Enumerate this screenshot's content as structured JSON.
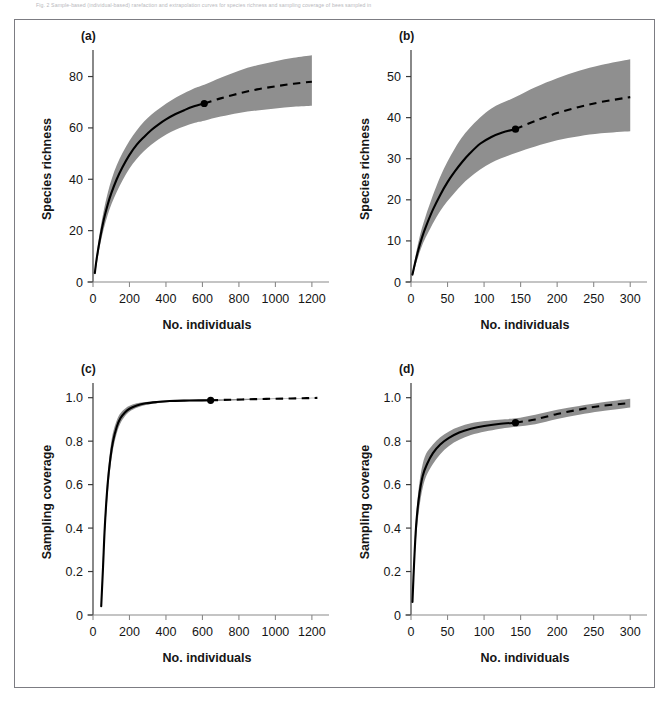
{
  "caption": {
    "text": "Fig. 2  Sample-based (individual-based) rarefaction and extrapolation curves for species richness and sampling coverage of bees sampled in"
  },
  "figure": {
    "background_color": "#ffffff",
    "frame_color": "#7c7c82",
    "band_color": "#8f8f8f",
    "line_color": "#000000"
  },
  "chart_data": [
    {
      "type": "line",
      "panel_label": "(a)",
      "title": "",
      "xlabel": "No. individuals",
      "ylabel": "Species richness",
      "xlim": [
        0,
        1250
      ],
      "ylim": [
        0,
        88
      ],
      "xticks": [
        0,
        200,
        400,
        600,
        800,
        1000,
        1200
      ],
      "xticklabels": [
        "0",
        "200",
        "400",
        "600",
        "800",
        "1000",
        "1200"
      ],
      "yticks": [
        0,
        20,
        40,
        60,
        80
      ],
      "yticklabels": [
        "0",
        "20",
        "40",
        "60",
        "80"
      ],
      "grid": false,
      "legend": "none",
      "observed_point": {
        "x": 610,
        "y": 69.5
      },
      "series": [
        {
          "name": "rarefaction (observed, solid)",
          "style": "solid",
          "x": [
            10,
            20,
            40,
            60,
            80,
            100,
            130,
            160,
            200,
            240,
            280,
            320,
            360,
            400,
            450,
            500,
            550,
            610
          ],
          "y": [
            3.5,
            9.0,
            17.5,
            24.5,
            30.0,
            34.5,
            40.0,
            44.5,
            49.5,
            53.5,
            56.5,
            59.2,
            61.4,
            63.3,
            65.3,
            66.9,
            68.3,
            69.5
          ]
        },
        {
          "name": "extrapolation (dashed)",
          "style": "dashed",
          "x": [
            610,
            700,
            800,
            900,
            1000,
            1100,
            1200
          ],
          "y": [
            69.5,
            71.5,
            73.4,
            75.0,
            76.2,
            77.2,
            78.0
          ]
        },
        {
          "name": "95% CI upper",
          "style": "band",
          "x": [
            10,
            40,
            80,
            130,
            200,
            280,
            360,
            450,
            550,
            610,
            700,
            800,
            900,
            1000,
            1100,
            1200
          ],
          "y": [
            5.0,
            20.5,
            34.5,
            45.5,
            55.0,
            62.5,
            67.4,
            71.6,
            75.2,
            76.8,
            79.5,
            82.3,
            84.4,
            86.0,
            87.3,
            88.3
          ]
        },
        {
          "name": "95% CI lower",
          "style": "band",
          "x": [
            10,
            40,
            80,
            130,
            200,
            280,
            360,
            450,
            550,
            610,
            700,
            800,
            900,
            1000,
            1100,
            1200
          ],
          "y": [
            2.2,
            14.8,
            26.0,
            35.0,
            44.2,
            51.0,
            55.6,
            59.2,
            61.8,
            62.8,
            64.4,
            65.8,
            66.8,
            67.6,
            68.2,
            68.6
          ]
        }
      ]
    },
    {
      "type": "line",
      "panel_label": "(b)",
      "title": "",
      "xlabel": "No. individuals",
      "ylabel": "Species richness",
      "xlim": [
        0,
        312
      ],
      "ylim": [
        0,
        55
      ],
      "xticks": [
        0,
        50,
        100,
        150,
        200,
        250,
        300
      ],
      "xticklabels": [
        "0",
        "50",
        "100",
        "150",
        "200",
        "250",
        "300"
      ],
      "yticks": [
        0,
        10,
        20,
        30,
        40,
        50
      ],
      "yticklabels": [
        "0",
        "10",
        "20",
        "30",
        "40",
        "50"
      ],
      "grid": false,
      "legend": "none",
      "observed_point": {
        "x": 143,
        "y": 37.2
      },
      "series": [
        {
          "name": "rarefaction (observed, solid)",
          "style": "solid",
          "x": [
            2,
            5,
            10,
            15,
            20,
            30,
            40,
            50,
            60,
            70,
            80,
            95,
            110,
            125,
            143
          ],
          "y": [
            1.8,
            4.2,
            7.8,
            10.8,
            13.3,
            17.6,
            21.2,
            24.3,
            26.9,
            29.2,
            31.2,
            33.7,
            35.3,
            36.4,
            37.2
          ]
        },
        {
          "name": "extrapolation (dashed)",
          "style": "dashed",
          "x": [
            143,
            170,
            200,
            230,
            260,
            300
          ],
          "y": [
            37.2,
            39.2,
            41.1,
            42.6,
            43.8,
            45.0
          ]
        },
        {
          "name": "95% CI upper",
          "style": "band",
          "x": [
            2,
            10,
            20,
            40,
            60,
            80,
            110,
            143,
            170,
            200,
            230,
            260,
            300
          ],
          "y": [
            2.4,
            9.6,
            16.0,
            25.6,
            32.5,
            37.4,
            42.2,
            45.0,
            47.4,
            49.6,
            51.4,
            52.8,
            54.2
          ]
        },
        {
          "name": "95% CI lower",
          "style": "band",
          "x": [
            2,
            10,
            20,
            40,
            60,
            80,
            110,
            143,
            170,
            200,
            230,
            260,
            300
          ],
          "y": [
            1.3,
            6.2,
            10.8,
            17.3,
            21.8,
            25.4,
            29.0,
            31.4,
            33.0,
            34.5,
            35.5,
            36.2,
            36.7
          ]
        }
      ]
    },
    {
      "type": "line",
      "panel_label": "(c)",
      "title": "",
      "xlabel": "No. individuals",
      "ylabel": "Sampling coverage",
      "xlim": [
        0,
        1250
      ],
      "ylim": [
        0,
        1.04
      ],
      "xticks": [
        0,
        200,
        400,
        600,
        800,
        1000,
        1200
      ],
      "xticklabels": [
        "0",
        "200",
        "400",
        "600",
        "800",
        "1000",
        "1200"
      ],
      "yticks": [
        0,
        0.2,
        0.4,
        0.6,
        0.8,
        1.0
      ],
      "yticklabels": [
        "0",
        "0.2",
        "0.4",
        "0.6",
        "0.8",
        "1.0"
      ],
      "grid": false,
      "legend": "none",
      "observed_point": {
        "x": 645,
        "y": 0.988
      },
      "series": [
        {
          "name": "coverage (observed, solid)",
          "style": "solid",
          "x": [
            45,
            55,
            65,
            80,
            95,
            110,
            130,
            150,
            175,
            200,
            240,
            290,
            350,
            420,
            500,
            580,
            645
          ],
          "y": [
            0.04,
            0.22,
            0.41,
            0.6,
            0.72,
            0.8,
            0.865,
            0.905,
            0.932,
            0.949,
            0.964,
            0.974,
            0.98,
            0.9845,
            0.9865,
            0.9875,
            0.988
          ]
        },
        {
          "name": "coverage extrapolation (dashed)",
          "style": "dashed",
          "x": [
            645,
            750,
            850,
            950,
            1050,
            1150,
            1230
          ],
          "y": [
            0.988,
            0.9905,
            0.9925,
            0.9945,
            0.996,
            0.9975,
            0.999
          ]
        },
        {
          "name": "95% CI upper",
          "style": "band",
          "x": [
            45,
            65,
            95,
            130,
            175,
            240,
            350,
            500,
            645,
            850,
            1050,
            1230
          ],
          "y": [
            0.05,
            0.455,
            0.765,
            0.895,
            0.949,
            0.974,
            0.985,
            0.99,
            0.992,
            0.9955,
            0.998,
            1.0
          ]
        },
        {
          "name": "95% CI lower",
          "style": "band",
          "x": [
            45,
            65,
            95,
            130,
            175,
            240,
            350,
            500,
            645,
            850,
            1050,
            1230
          ],
          "y": [
            0.03,
            0.37,
            0.675,
            0.835,
            0.915,
            0.954,
            0.975,
            0.983,
            0.984,
            0.989,
            0.995,
            0.998
          ]
        }
      ]
    },
    {
      "type": "line",
      "panel_label": "(d)",
      "title": "",
      "xlabel": "No. individuals",
      "ylabel": "Sampling coverage",
      "xlim": [
        0,
        312
      ],
      "ylim": [
        0,
        1.04
      ],
      "xticks": [
        0,
        50,
        100,
        150,
        200,
        250,
        300
      ],
      "xticklabels": [
        "0",
        "50",
        "100",
        "150",
        "200",
        "250",
        "300"
      ],
      "yticks": [
        0,
        0.2,
        0.4,
        0.6,
        0.8,
        1.0
      ],
      "yticklabels": [
        "0",
        "0.2",
        "0.4",
        "0.6",
        "0.8",
        "1.0"
      ],
      "grid": false,
      "legend": "none",
      "observed_point": {
        "x": 143,
        "y": 0.885
      },
      "series": [
        {
          "name": "coverage (observed, solid)",
          "style": "solid",
          "x": [
            2,
            4,
            7,
            11,
            16,
            22,
            30,
            40,
            52,
            66,
            82,
            100,
            120,
            143
          ],
          "y": [
            0.06,
            0.22,
            0.41,
            0.545,
            0.64,
            0.695,
            0.745,
            0.785,
            0.815,
            0.84,
            0.857,
            0.87,
            0.879,
            0.885
          ]
        },
        {
          "name": "coverage extrapolation (dashed)",
          "style": "dashed",
          "x": [
            143,
            170,
            200,
            230,
            260,
            300
          ],
          "y": [
            0.885,
            0.9,
            0.925,
            0.945,
            0.962,
            0.975
          ]
        },
        {
          "name": "95% CI upper",
          "style": "band",
          "x": [
            2,
            7,
            16,
            30,
            52,
            82,
            120,
            143,
            170,
            200,
            230,
            260,
            300
          ],
          "y": [
            0.08,
            0.455,
            0.695,
            0.785,
            0.845,
            0.882,
            0.898,
            0.905,
            0.922,
            0.944,
            0.962,
            0.978,
            0.995
          ]
        },
        {
          "name": "95% CI lower",
          "style": "band",
          "x": [
            2,
            7,
            16,
            30,
            52,
            82,
            120,
            143,
            170,
            200,
            230,
            260,
            300
          ],
          "y": [
            0.045,
            0.355,
            0.585,
            0.695,
            0.778,
            0.828,
            0.856,
            0.866,
            0.878,
            0.902,
            0.922,
            0.938,
            0.955
          ]
        }
      ]
    }
  ]
}
